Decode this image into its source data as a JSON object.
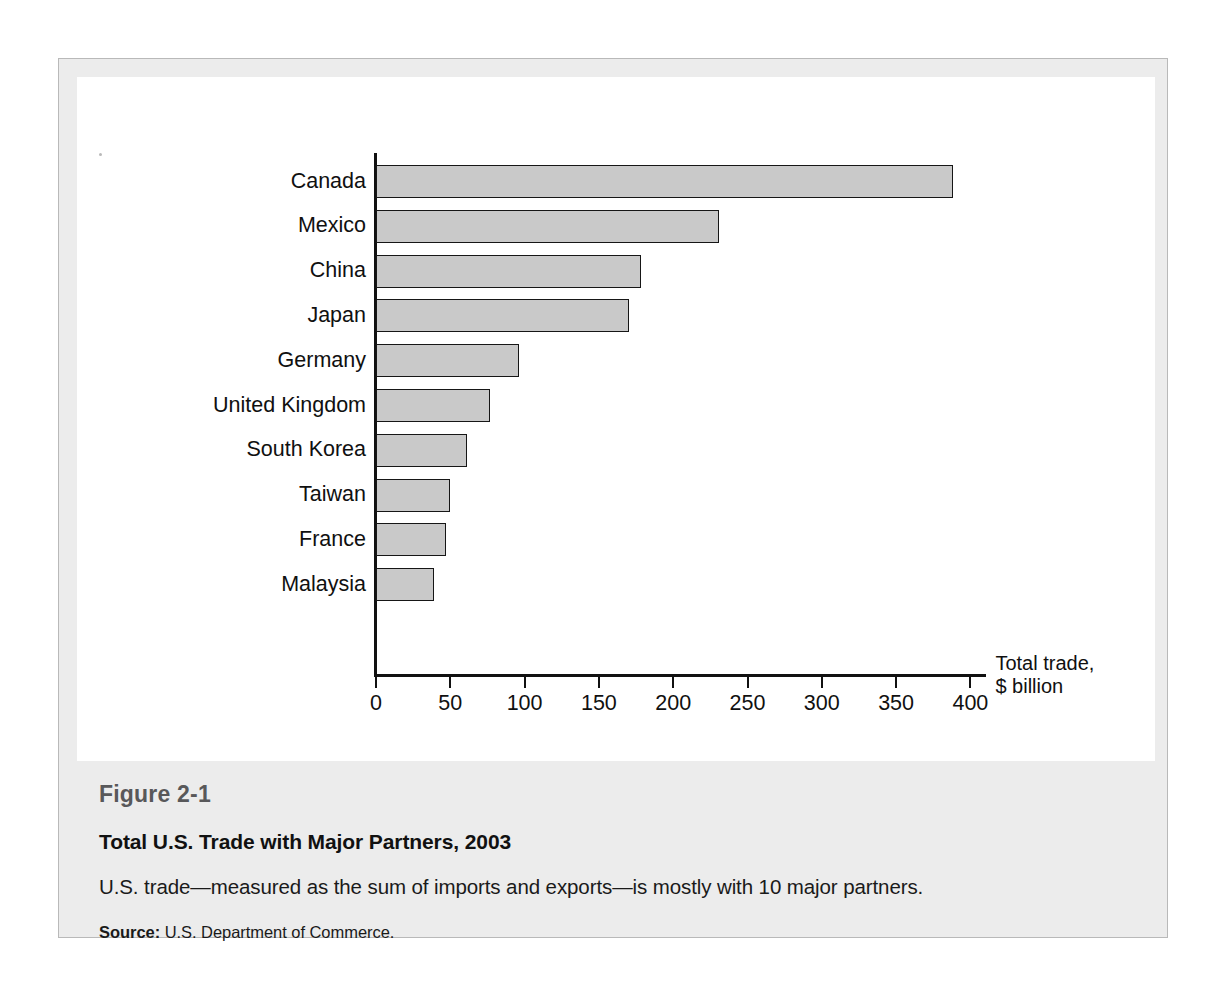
{
  "figure": {
    "number": "Figure 2-1",
    "title": "Total U.S. Trade with Major Partners, 2003",
    "description": "U.S. trade—measured as the sum of imports and exports—is mostly with 10 major partners.",
    "source_label": "Source:",
    "source_text": "U.S. Department of Commerce."
  },
  "colors": {
    "bar_fill": "#c9c9c9",
    "bar_outline": "#161616",
    "axis": "#111111",
    "panel_background": "#ffffff",
    "frame_background": "#ececec",
    "frame_border": "#b9b9b9",
    "figure_number_text": "#58585a"
  },
  "chart_data": {
    "type": "bar",
    "orientation": "horizontal",
    "title": "Total U.S. Trade with Major Partners, 2003",
    "xlabel": "Total trade, $ billion",
    "ylabel": "",
    "axis_label_lines": [
      "Total trade,",
      "$ billion"
    ],
    "categories": [
      "Canada",
      "Mexico",
      "China",
      "Japan",
      "Germany",
      "United Kingdom",
      "South Korea",
      "Taiwan",
      "France",
      "Malaysia"
    ],
    "values": [
      388,
      231,
      178,
      170,
      96,
      77,
      61,
      50,
      47,
      39
    ],
    "xlim": [
      0,
      400
    ],
    "xticks": [
      0,
      50,
      100,
      150,
      200,
      250,
      300,
      350,
      400
    ],
    "xtick_labels": [
      "0",
      "50",
      "100",
      "150",
      "200",
      "250",
      "300",
      "350",
      "400"
    ],
    "grid": false,
    "legend": false,
    "units": "$ billion"
  }
}
